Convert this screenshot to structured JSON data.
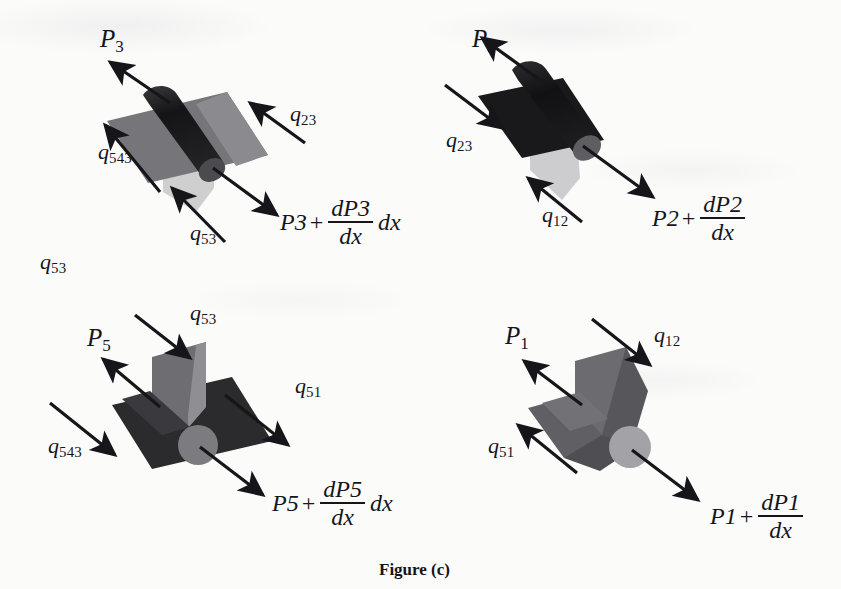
{
  "figure": {
    "caption": "Figure (c)",
    "stray_label": {
      "base": "q",
      "sub": "53"
    }
  },
  "panels": [
    {
      "id": "panel-p3",
      "name": "control-volume-element-3",
      "pressure_in": {
        "base": "P",
        "sub": "3"
      },
      "pressure_out": {
        "lead": "P",
        "lead_sub": "3",
        "num": "dP",
        "num_sub": "3",
        "den": "dx",
        "tail": "dx"
      },
      "flux_labels": [
        {
          "base": "q",
          "sub": "23"
        },
        {
          "base": "q",
          "sub": "543"
        },
        {
          "base": "q",
          "sub": "53"
        }
      ]
    },
    {
      "id": "panel-p2",
      "name": "control-volume-element-2",
      "pressure_in": {
        "base": "P",
        "sub": "2"
      },
      "pressure_out": {
        "lead": "P",
        "lead_sub": "2",
        "num": "dP",
        "num_sub": "2",
        "den": "dx",
        "tail": ""
      },
      "flux_labels": [
        {
          "base": "q",
          "sub": "23"
        },
        {
          "base": "q",
          "sub": "12"
        }
      ]
    },
    {
      "id": "panel-p5",
      "name": "control-volume-element-5",
      "pressure_in": {
        "base": "P",
        "sub": "5"
      },
      "pressure_out": {
        "lead": "P",
        "lead_sub": "5",
        "num": "dP",
        "num_sub": "5",
        "den": "dx",
        "tail": "dx"
      },
      "flux_labels": [
        {
          "base": "q",
          "sub": "53"
        },
        {
          "base": "q",
          "sub": "51"
        },
        {
          "base": "q",
          "sub": "543"
        }
      ]
    },
    {
      "id": "panel-p1",
      "name": "control-volume-element-1",
      "pressure_in": {
        "base": "P",
        "sub": "1"
      },
      "pressure_out": {
        "lead": "P",
        "lead_sub": "1",
        "num": "dP",
        "num_sub": "1",
        "den": "dx",
        "tail": ""
      },
      "flux_labels": [
        {
          "base": "q",
          "sub": "12"
        },
        {
          "base": "q",
          "sub": "51"
        }
      ]
    }
  ],
  "colors": {
    "ink": "#15151a",
    "paper": "#fbfbfa",
    "dark_solid": "#1c1c1e",
    "mid_gray": "#6f6f73",
    "light_gray": "#b9b9bb",
    "pale_gray": "#d2d2d3"
  }
}
